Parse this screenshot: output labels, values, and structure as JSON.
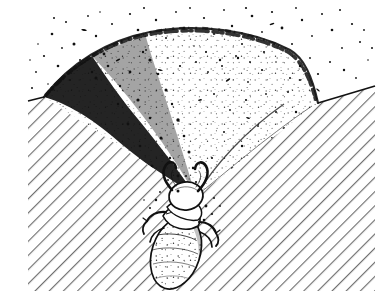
{
  "figure": {
    "domain": "natural-image",
    "kind": "line-art-illustration",
    "caption": "",
    "title": "",
    "canvas": {
      "width": 388,
      "height": 308,
      "background": "#ffffff"
    },
    "content_bounds": {
      "left": 28,
      "top": 6,
      "right": 375,
      "bottom": 291
    },
    "colors": {
      "ink": "#111111",
      "paper": "#ffffff",
      "hatch": "#6f6f6f",
      "stipple_dark": "#1a1a1a",
      "stipple_light": "#3a3a3a"
    }
  },
  "scene": {
    "ground": {
      "name": "cross-sectioned-sand-substrate",
      "hatching": {
        "style": "parallel-diagonal",
        "angle_deg": 45,
        "direction": "lower-left-to-upper-right",
        "spacing_px": 10,
        "stroke_width_px": 1.1,
        "color": "#6f6f6f"
      },
      "left_slope_label": "near-wall-of-pit",
      "right_slope_label": "far-wall-of-pit"
    },
    "pit": {
      "name": "conical-pit-trap",
      "shape": "fan-sector",
      "apex": {
        "x": 196,
        "y": 196
      },
      "rim_left": {
        "x": 44,
        "y": 97
      },
      "rim_right": {
        "x": 318,
        "y": 103
      },
      "rim_crest_y": 34,
      "shading": {
        "left_region": "dark-dense-stipple",
        "right_region": "light-sparse-stipple",
        "description": "loose-sand-funnel-wall"
      }
    },
    "ejecta": {
      "name": "flung-sand-grains",
      "region": "above-pit-rim",
      "count": 150,
      "description": "scattered specks of tossed sand"
    },
    "antlion": {
      "name": "antlion-larva",
      "common_name": "doodlebug",
      "position": {
        "x": 182,
        "y": 240
      },
      "orientation_deg": 18,
      "parts": [
        {
          "name": "abdomen",
          "shape": "elongate-oval",
          "texture": "stippled"
        },
        {
          "name": "thorax",
          "shape": "segmented-bands"
        },
        {
          "name": "head",
          "shape": "rounded-capsule"
        },
        {
          "name": "left-mandible",
          "shape": "curved-sickle"
        },
        {
          "name": "right-mandible",
          "shape": "curved-sickle"
        },
        {
          "name": "legs",
          "shape": "short-spined"
        }
      ]
    }
  },
  "labels": {
    "pit": "",
    "antlion": "",
    "sand": ""
  }
}
